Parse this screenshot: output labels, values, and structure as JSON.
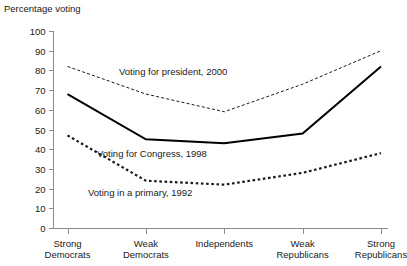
{
  "chart_data": {
    "type": "line",
    "title": "",
    "ylabel": "Percentage voting",
    "xlabel": "",
    "ylim": [
      0,
      100
    ],
    "yticks": [
      0,
      10,
      20,
      30,
      40,
      50,
      60,
      70,
      80,
      90,
      100
    ],
    "grid": false,
    "legend_position": "inline-annotations",
    "categories": [
      "Strong\nDemocrats",
      "Weak\nDemocrats",
      "Independents",
      "Weak\nRepublicans",
      "Strong\nRepublicans"
    ],
    "series": [
      {
        "name": "Voting for president, 2000",
        "style": "fine-dashed",
        "color": "#1a1a1a",
        "values": [
          82,
          68,
          59,
          73,
          90
        ]
      },
      {
        "name": "Voting for Congress, 1998",
        "style": "solid",
        "color": "#000000",
        "values": [
          68,
          45,
          43,
          48,
          82
        ]
      },
      {
        "name": "Voting in a primary, 1992",
        "style": "bold-dotted",
        "color": "#1a1a1a",
        "values": [
          47,
          24,
          22,
          28,
          38
        ]
      }
    ],
    "annotations": [
      {
        "text": "Voting for president, 2000",
        "x": 119,
        "y": 66
      },
      {
        "text": "Voting for Congress, 1998",
        "x": 97,
        "y": 148
      },
      {
        "text": "Voting in a primary, 1992",
        "x": 88,
        "y": 187
      }
    ]
  },
  "axis": {
    "y_title": "Percentage voting",
    "y_tick_labels": [
      "100",
      "90",
      "80",
      "70",
      "60",
      "50",
      "40",
      "30",
      "20",
      "10",
      "0"
    ],
    "x_tick_labels": [
      "Strong\nDemocrats",
      "Weak\nDemocrats",
      "Independents",
      "Weak\nRepublicans",
      "Strong\nRepublicans"
    ]
  },
  "colors": {
    "axis": "#8a8a8a",
    "text": "#1a1a1a",
    "line": "#000000"
  }
}
